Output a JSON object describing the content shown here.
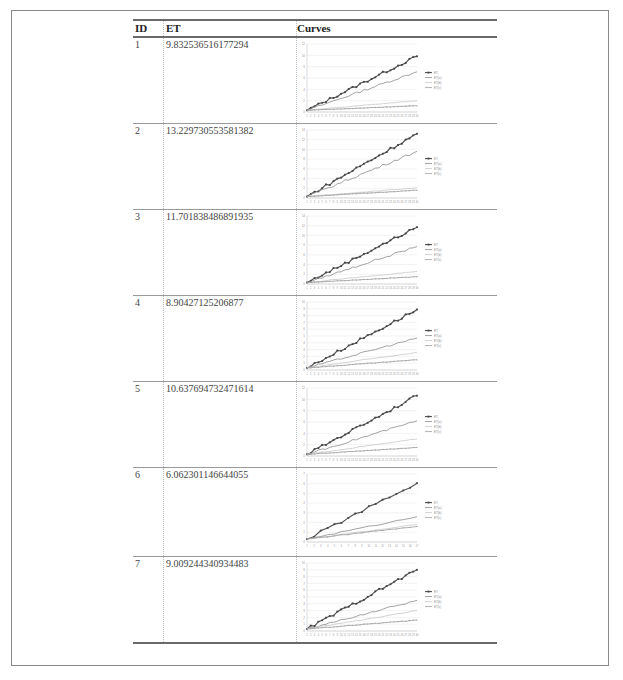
{
  "table": {
    "headers": {
      "id": "ID",
      "et": "ET",
      "curves": "Curves"
    },
    "rows": [
      {
        "id": "1",
        "et": "9.832536516177294"
      },
      {
        "id": "2",
        "et": "13.229730553581382"
      },
      {
        "id": "3",
        "et": "11.701838486891935"
      },
      {
        "id": "4",
        "et": "8.90427125206877"
      },
      {
        "id": "5",
        "et": "10.637694732471614"
      },
      {
        "id": "6",
        "et": "6.062301146644055"
      },
      {
        "id": "7",
        "et": "9.009244340934483"
      }
    ]
  },
  "colors": {
    "series": [
      "#555555",
      "#8c8c8c",
      "#c8c8c8",
      "#9e9e9e"
    ],
    "grid": "#e6e6e6",
    "frame": "#8a8a8a"
  },
  "chart_data": [
    {
      "type": "line",
      "title": "",
      "n": 30,
      "ylim": [
        0,
        12
      ],
      "yticks": [
        0,
        2,
        4,
        6,
        8,
        10,
        12
      ],
      "legend": [
        "ET",
        "ET(a)",
        "ET(b)",
        "ET(c)"
      ],
      "legend_position": "right",
      "grid": true,
      "series": [
        {
          "name": "ET",
          "end": 9.83
        },
        {
          "name": "ET(a)",
          "end": 7.1
        },
        {
          "name": "ET(b)",
          "end": 2.0
        },
        {
          "name": "ET(c)",
          "end": 1.1
        }
      ]
    },
    {
      "type": "line",
      "title": "",
      "n": 30,
      "ylim": [
        0,
        14
      ],
      "yticks": [
        0,
        2,
        4,
        6,
        8,
        10,
        12,
        14
      ],
      "legend": [
        "ET",
        "ET(a)",
        "ET(b)",
        "ET(c)"
      ],
      "legend_position": "right",
      "grid": true,
      "series": [
        {
          "name": "ET",
          "end": 13.23
        },
        {
          "name": "ET(a)",
          "end": 9.6
        },
        {
          "name": "ET(b)",
          "end": 2.1
        },
        {
          "name": "ET(c)",
          "end": 1.6
        }
      ]
    },
    {
      "type": "line",
      "title": "",
      "n": 30,
      "ylim": [
        0,
        14
      ],
      "yticks": [
        0,
        2,
        4,
        6,
        8,
        10,
        12,
        14
      ],
      "legend": [
        "ET",
        "ET(a)",
        "ET(b)",
        "ET(c)"
      ],
      "legend_position": "right",
      "grid": true,
      "series": [
        {
          "name": "ET",
          "end": 11.7
        },
        {
          "name": "ET(a)",
          "end": 7.7
        },
        {
          "name": "ET(b)",
          "end": 2.6
        },
        {
          "name": "ET(c)",
          "end": 1.5
        }
      ]
    },
    {
      "type": "line",
      "title": "",
      "n": 30,
      "ylim": [
        0,
        10
      ],
      "yticks": [
        0,
        1,
        2,
        3,
        4,
        5,
        6,
        7,
        8,
        9,
        10
      ],
      "legend": [
        "ET",
        "ET(a)",
        "ET(b)",
        "ET(c)"
      ],
      "legend_position": "right",
      "grid": true,
      "series": [
        {
          "name": "ET",
          "end": 8.9
        },
        {
          "name": "ET(a)",
          "end": 4.7
        },
        {
          "name": "ET(b)",
          "end": 2.6
        },
        {
          "name": "ET(c)",
          "end": 1.5
        }
      ]
    },
    {
      "type": "line",
      "title": "",
      "n": 30,
      "ylim": [
        0,
        12
      ],
      "yticks": [
        0,
        2,
        4,
        6,
        8,
        10,
        12
      ],
      "legend": [
        "ET",
        "ET(a)",
        "ET(b)",
        "ET(c)"
      ],
      "legend_position": "right",
      "grid": true,
      "series": [
        {
          "name": "ET",
          "end": 10.64
        },
        {
          "name": "ET(a)",
          "end": 6.2
        },
        {
          "name": "ET(b)",
          "end": 3.0
        },
        {
          "name": "ET(c)",
          "end": 1.5
        }
      ]
    },
    {
      "type": "line",
      "title": "",
      "n": 17,
      "ylim": [
        0,
        7
      ],
      "yticks": [
        0,
        1,
        2,
        3,
        4,
        5,
        6,
        7
      ],
      "legend": [
        "ET",
        "ET(a)",
        "ET(b)",
        "ET(c)"
      ],
      "legend_position": "right",
      "grid": true,
      "series": [
        {
          "name": "ET",
          "end": 6.06
        },
        {
          "name": "ET(a)",
          "end": 2.6
        },
        {
          "name": "ET(b)",
          "end": 1.8
        },
        {
          "name": "ET(c)",
          "end": 1.6
        }
      ]
    },
    {
      "type": "line",
      "title": "",
      "n": 30,
      "ylim": [
        0,
        10
      ],
      "yticks": [
        0,
        1,
        2,
        3,
        4,
        5,
        6,
        7,
        8,
        9,
        10
      ],
      "legend": [
        "ET",
        "ET(a)",
        "ET(b)",
        "ET(c)"
      ],
      "legend_position": "right",
      "grid": true,
      "series": [
        {
          "name": "ET",
          "end": 9.0
        },
        {
          "name": "ET(a)",
          "end": 4.5
        },
        {
          "name": "ET(b)",
          "end": 3.0
        },
        {
          "name": "ET(c)",
          "end": 1.6
        }
      ]
    }
  ]
}
